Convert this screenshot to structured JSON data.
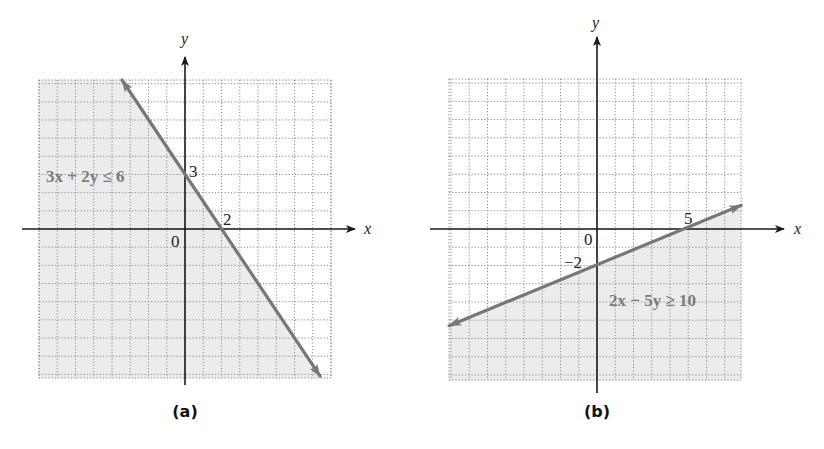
{
  "chart_data": [
    {
      "id": "a",
      "type": "line",
      "caption": "(a)",
      "title": "",
      "xlabel": "x",
      "ylabel": "y",
      "xlim": [
        -8,
        8
      ],
      "ylim": [
        -8.2,
        8.2
      ],
      "grid": true,
      "grid_step": 1,
      "boundary": {
        "equation": "3x + 2y = 6",
        "a": 3,
        "b": 2,
        "c": 6
      },
      "inequality_label": "3x + 2y ≤ 6",
      "shaded_region": "below-left (3x + 2y ≤ 6)",
      "line_endpoints": [
        [
          -3.45,
          8.2
        ],
        [
          7.4,
          -8.1
        ]
      ],
      "arrows": "both",
      "annotations": [
        {
          "text": "3",
          "x": 0,
          "y": 3,
          "meaning": "y-intercept"
        },
        {
          "text": "2",
          "x": 2,
          "y": 0,
          "meaning": "x-intercept"
        },
        {
          "text": "0",
          "x": 0,
          "y": 0,
          "meaning": "origin"
        }
      ],
      "colors": {
        "shade": "#ececec",
        "boundary": "#777777",
        "label": "#7a7a7a"
      }
    },
    {
      "id": "b",
      "type": "line",
      "caption": "(b)",
      "title": "",
      "xlabel": "x",
      "ylabel": "y",
      "xlim": [
        -8.1,
        7.9
      ],
      "ylim": [
        -8.3,
        8.2
      ],
      "grid": true,
      "grid_step": 1,
      "boundary": {
        "equation": "2x - 5y = 10",
        "a": 2,
        "b": -5,
        "c": 10
      },
      "inequality_label": "2x − 5y ≥ 10",
      "shaded_region": "below-right (2x − 5y ≥ 10)",
      "line_endpoints": [
        [
          -8.1,
          -5.3
        ],
        [
          7.9,
          1.3
        ]
      ],
      "arrows": "both",
      "annotations": [
        {
          "text": "5",
          "x": 5,
          "y": 0,
          "meaning": "x-intercept"
        },
        {
          "text": "−2",
          "x": 0,
          "y": -2,
          "meaning": "y-intercept"
        },
        {
          "text": "0",
          "x": 0,
          "y": 0,
          "meaning": "origin"
        }
      ],
      "colors": {
        "shade": "#ececec",
        "boundary": "#777777",
        "label": "#7a7a7a"
      }
    }
  ]
}
